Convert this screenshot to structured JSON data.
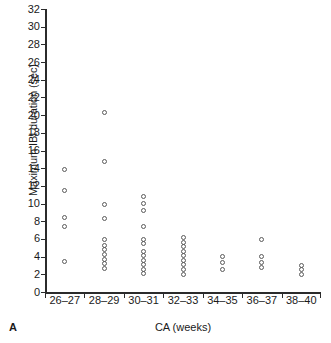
{
  "panel": {
    "letter": "A"
  },
  "chart_data": {
    "type": "scatter",
    "title": "",
    "xlabel": "CA (weeks)",
    "ylabel": "Maximum IBI duration (sec)",
    "ylim": [
      0,
      32
    ],
    "ytick_values": [
      0,
      2,
      4,
      6,
      8,
      10,
      12,
      14,
      16,
      18,
      20,
      22,
      24,
      26,
      28,
      30,
      32
    ],
    "ytick_labels": [
      "0",
      "2",
      "4",
      "6",
      "8",
      "10",
      "12",
      "14",
      "16",
      "18",
      "20",
      "22",
      "24",
      "26",
      "28",
      "30",
      "32"
    ],
    "categories": [
      "26–27",
      "28–29",
      "30–31",
      "32–33",
      "34–35",
      "36–37",
      "38–40"
    ],
    "grid": false,
    "legend": null,
    "marker": "open-circle",
    "marker_color": "#5a5a5a",
    "series": [
      {
        "name": "Maximum IBI duration",
        "points": [
          {
            "category": "26–27",
            "cat_index": 0,
            "x_offset": 0,
            "y": 13.9
          },
          {
            "category": "26–27",
            "cat_index": 0,
            "x_offset": 0,
            "y": 11.5
          },
          {
            "category": "26–27",
            "cat_index": 0,
            "x_offset": 0,
            "y": 8.4
          },
          {
            "category": "26–27",
            "cat_index": 0,
            "x_offset": 0,
            "y": 7.4
          },
          {
            "category": "26–27",
            "cat_index": 0,
            "x_offset": 0,
            "y": 3.4
          },
          {
            "category": "28–29",
            "cat_index": 1,
            "x_offset": 0,
            "y": 20.3
          },
          {
            "category": "28–29",
            "cat_index": 1,
            "x_offset": 0,
            "y": 14.8
          },
          {
            "category": "28–29",
            "cat_index": 1,
            "x_offset": 0,
            "y": 9.9
          },
          {
            "category": "28–29",
            "cat_index": 1,
            "x_offset": 0,
            "y": 8.3
          },
          {
            "category": "28–29",
            "cat_index": 1,
            "x_offset": 0,
            "y": 5.9
          },
          {
            "category": "28–29",
            "cat_index": 1,
            "x_offset": 0,
            "y": 5.3
          },
          {
            "category": "28–29",
            "cat_index": 1,
            "x_offset": 0,
            "y": 4.8
          },
          {
            "category": "28–29",
            "cat_index": 1,
            "x_offset": 0,
            "y": 4.2
          },
          {
            "category": "28–29",
            "cat_index": 1,
            "x_offset": 0,
            "y": 3.7
          },
          {
            "category": "28–29",
            "cat_index": 1,
            "x_offset": 0,
            "y": 3.2
          },
          {
            "category": "28–29",
            "cat_index": 1,
            "x_offset": 0,
            "y": 2.7
          },
          {
            "category": "30–31",
            "cat_index": 2,
            "x_offset": 0,
            "y": 10.8
          },
          {
            "category": "30–31",
            "cat_index": 2,
            "x_offset": 0,
            "y": 10.0
          },
          {
            "category": "30–31",
            "cat_index": 2,
            "x_offset": 0,
            "y": 9.2
          },
          {
            "category": "30–31",
            "cat_index": 2,
            "x_offset": 0,
            "y": 7.4
          },
          {
            "category": "30–31",
            "cat_index": 2,
            "x_offset": 0,
            "y": 5.9
          },
          {
            "category": "30–31",
            "cat_index": 2,
            "x_offset": 0,
            "y": 5.5
          },
          {
            "category": "30–31",
            "cat_index": 2,
            "x_offset": 0,
            "y": 4.6
          },
          {
            "category": "30–31",
            "cat_index": 2,
            "x_offset": 0,
            "y": 4.1
          },
          {
            "category": "30–31",
            "cat_index": 2,
            "x_offset": 0,
            "y": 3.6
          },
          {
            "category": "30–31",
            "cat_index": 2,
            "x_offset": 0,
            "y": 3.1
          },
          {
            "category": "30–31",
            "cat_index": 2,
            "x_offset": 0,
            "y": 2.6
          },
          {
            "category": "30–31",
            "cat_index": 2,
            "x_offset": 0,
            "y": 2.1
          },
          {
            "category": "32–33",
            "cat_index": 3,
            "x_offset": 0,
            "y": 6.2
          },
          {
            "category": "32–33",
            "cat_index": 3,
            "x_offset": 0,
            "y": 5.6
          },
          {
            "category": "32–33",
            "cat_index": 3,
            "x_offset": 0,
            "y": 5.1
          },
          {
            "category": "32–33",
            "cat_index": 3,
            "x_offset": 0,
            "y": 4.6
          },
          {
            "category": "32–33",
            "cat_index": 3,
            "x_offset": 0,
            "y": 4.1
          },
          {
            "category": "32–33",
            "cat_index": 3,
            "x_offset": 0,
            "y": 3.6
          },
          {
            "category": "32–33",
            "cat_index": 3,
            "x_offset": 0,
            "y": 3.1
          },
          {
            "category": "32–33",
            "cat_index": 3,
            "x_offset": 0,
            "y": 2.6
          },
          {
            "category": "32–33",
            "cat_index": 3,
            "x_offset": 0,
            "y": 2.0
          },
          {
            "category": "34–35",
            "cat_index": 4,
            "x_offset": 0,
            "y": 4.0
          },
          {
            "category": "34–35",
            "cat_index": 4,
            "x_offset": 0,
            "y": 3.3
          },
          {
            "category": "34–35",
            "cat_index": 4,
            "x_offset": 0,
            "y": 2.6
          },
          {
            "category": "36–37",
            "cat_index": 5,
            "x_offset": 0,
            "y": 5.9
          },
          {
            "category": "36–37",
            "cat_index": 5,
            "x_offset": 0,
            "y": 4.0
          },
          {
            "category": "36–37",
            "cat_index": 5,
            "x_offset": 0,
            "y": 3.3
          },
          {
            "category": "36–37",
            "cat_index": 5,
            "x_offset": 0,
            "y": 2.8
          },
          {
            "category": "38–40",
            "cat_index": 6,
            "x_offset": 0,
            "y": 3.0
          },
          {
            "category": "38–40",
            "cat_index": 6,
            "x_offset": 0,
            "y": 2.5
          },
          {
            "category": "38–40",
            "cat_index": 6,
            "x_offset": 0,
            "y": 2.0
          }
        ]
      }
    ]
  }
}
